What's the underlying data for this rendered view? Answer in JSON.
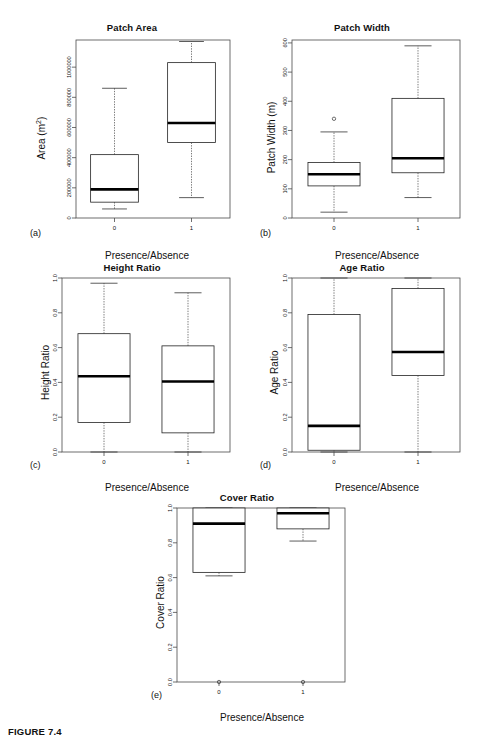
{
  "figure": {
    "caption": "FIGURE 7.4",
    "shared_xlabel": "Presence/Absence",
    "group_labels": [
      "0",
      "1"
    ]
  },
  "panels": [
    {
      "tag": "(a)",
      "title": "Patch Area",
      "ylabel_main": "Area (m",
      "ylabel_sup": "2",
      "ylabel_tail": ")"
    },
    {
      "tag": "(b)",
      "title": "Patch Width",
      "ylabel_main": "Patch Width (m)",
      "ylabel_sup": "",
      "ylabel_tail": ""
    },
    {
      "tag": "(c)",
      "title": "Height Ratio",
      "ylabel_main": "Height Ratio",
      "ylabel_sup": "",
      "ylabel_tail": ""
    },
    {
      "tag": "(d)",
      "title": "Age Ratio",
      "ylabel_main": "Age Ratio",
      "ylabel_sup": "",
      "ylabel_tail": ""
    },
    {
      "tag": "(e)",
      "title": "Cover Ratio",
      "ylabel_main": "Cover Ratio",
      "ylabel_sup": "",
      "ylabel_tail": ""
    }
  ],
  "chart_data": [
    {
      "type": "box",
      "panel": "a",
      "title": "Patch Area",
      "xlabel": "Presence/Absence",
      "ylabel": "Area (m2)",
      "categories": [
        "0",
        "1"
      ],
      "ylim": [
        0,
        1180000
      ],
      "yticks": [
        0,
        200000,
        400000,
        600000,
        800000,
        1000000
      ],
      "ytick_labels": [
        "0",
        "200000",
        "400000",
        "600000",
        "800000",
        "1000000"
      ],
      "grid": false,
      "boxes": [
        {
          "category": "0",
          "whisker_low": 60000,
          "q1": 105000,
          "median": 190000,
          "q3": 420000,
          "whisker_high": 860000,
          "outliers": []
        },
        {
          "category": "1",
          "whisker_low": 135000,
          "q1": 500000,
          "median": 630000,
          "q3": 1030000,
          "whisker_high": 1170000,
          "outliers": []
        }
      ]
    },
    {
      "type": "box",
      "panel": "b",
      "title": "Patch Width",
      "xlabel": "Presence/Absence",
      "ylabel": "Patch Width (m)",
      "categories": [
        "0",
        "1"
      ],
      "ylim": [
        0,
        610
      ],
      "yticks": [
        0,
        100,
        200,
        300,
        400,
        500,
        600
      ],
      "ytick_labels": [
        "0",
        "100",
        "200",
        "300",
        "400",
        "500",
        "600"
      ],
      "grid": false,
      "boxes": [
        {
          "category": "0",
          "whisker_low": 20,
          "q1": 110,
          "median": 150,
          "q3": 190,
          "whisker_high": 295,
          "outliers": [
            340
          ]
        },
        {
          "category": "1",
          "whisker_low": 70,
          "q1": 155,
          "median": 205,
          "q3": 410,
          "whisker_high": 590,
          "outliers": []
        }
      ]
    },
    {
      "type": "box",
      "panel": "c",
      "title": "Height Ratio",
      "xlabel": "Presence/Absence",
      "ylabel": "Height Ratio",
      "categories": [
        "0",
        "1"
      ],
      "ylim": [
        0.0,
        1.0
      ],
      "yticks": [
        0.0,
        0.2,
        0.4,
        0.6,
        0.8,
        1.0
      ],
      "ytick_labels": [
        "0.0",
        "0.2",
        "0.4",
        "0.6",
        "0.8",
        "1.0"
      ],
      "grid": false,
      "boxes": [
        {
          "category": "0",
          "whisker_low": 0.0,
          "q1": 0.17,
          "median": 0.435,
          "q3": 0.68,
          "whisker_high": 0.97,
          "outliers": []
        },
        {
          "category": "1",
          "whisker_low": 0.0,
          "q1": 0.11,
          "median": 0.405,
          "q3": 0.61,
          "whisker_high": 0.915,
          "outliers": []
        }
      ]
    },
    {
      "type": "box",
      "panel": "d",
      "title": "Age Ratio",
      "xlabel": "Presence/Absence",
      "ylabel": "Age Ratio",
      "categories": [
        "0",
        "1"
      ],
      "ylim": [
        0.0,
        1.0
      ],
      "yticks": [
        0.0,
        0.2,
        0.4,
        0.6,
        0.8,
        1.0
      ],
      "ytick_labels": [
        "0.0",
        "0.2",
        "0.4",
        "0.6",
        "0.8",
        "1.0"
      ],
      "grid": false,
      "boxes": [
        {
          "category": "0",
          "whisker_low": 0.0,
          "q1": 0.01,
          "median": 0.15,
          "q3": 0.79,
          "whisker_high": 1.0,
          "outliers": []
        },
        {
          "category": "1",
          "whisker_low": 0.0,
          "q1": 0.44,
          "median": 0.575,
          "q3": 0.94,
          "whisker_high": 1.0,
          "outliers": []
        }
      ]
    },
    {
      "type": "box",
      "panel": "e",
      "title": "Cover Ratio",
      "xlabel": "Presence/Absence",
      "ylabel": "Cover Ratio",
      "categories": [
        "0",
        "1"
      ],
      "ylim": [
        0.0,
        1.0
      ],
      "yticks": [
        0.0,
        0.2,
        0.4,
        0.6,
        0.8,
        1.0
      ],
      "ytick_labels": [
        "0.0",
        "0.2",
        "0.4",
        "0.6",
        "0.8",
        "1.0"
      ],
      "grid": false,
      "boxes": [
        {
          "category": "0",
          "whisker_low": 0.61,
          "q1": 0.63,
          "median": 0.91,
          "q3": 1.0,
          "whisker_high": 1.0,
          "outliers": [
            0.0
          ]
        },
        {
          "category": "1",
          "whisker_low": 0.81,
          "q1": 0.88,
          "median": 0.97,
          "q3": 1.0,
          "whisker_high": 1.0,
          "outliers": [
            0.0
          ]
        }
      ]
    }
  ]
}
